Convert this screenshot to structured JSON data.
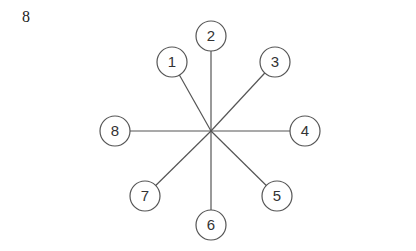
{
  "figure_label": "8",
  "center": {
    "x": 211,
    "y": 131
  },
  "node_radius": 15,
  "line_color": "#555555",
  "nodes": [
    {
      "id": "1",
      "x": 172,
      "y": 62
    },
    {
      "id": "2",
      "x": 211,
      "y": 36
    },
    {
      "id": "3",
      "x": 275,
      "y": 62
    },
    {
      "id": "4",
      "x": 305,
      "y": 131
    },
    {
      "id": "5",
      "x": 277,
      "y": 196
    },
    {
      "id": "6",
      "x": 211,
      "y": 225
    },
    {
      "id": "7",
      "x": 145,
      "y": 196
    },
    {
      "id": "8",
      "x": 115,
      "y": 131
    }
  ]
}
